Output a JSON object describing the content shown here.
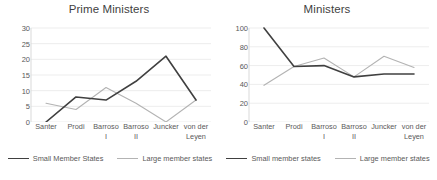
{
  "colors": {
    "small_member_states": "#404040",
    "large_member_states": "#b3b3b3",
    "text": "#595959",
    "title": "#3f3f3f",
    "gridline": "#ededed",
    "background": "#ffffff"
  },
  "charts": [
    {
      "id": "prime-ministers",
      "title": "Prime Ministers",
      "legend": [
        {
          "label": "Small Member States",
          "key": "small"
        },
        {
          "label": "Large member states",
          "key": "large"
        }
      ]
    },
    {
      "id": "ministers",
      "title": "Ministers",
      "legend": [
        {
          "label": "Small member states",
          "key": "small"
        },
        {
          "label": "Large member states",
          "key": "large"
        }
      ]
    }
  ],
  "chart_data": [
    {
      "type": "line",
      "title": "Prime Ministers",
      "xlabel": "",
      "ylabel": "",
      "categories": [
        "Santer",
        "Prodi",
        "Barroso I",
        "Barroso II",
        "Juncker",
        "von der Leyen"
      ],
      "category_lines": [
        [
          "Santer"
        ],
        [
          "Prodi"
        ],
        [
          "Barroso",
          "I"
        ],
        [
          "Barroso",
          "II"
        ],
        [
          "Juncker"
        ],
        [
          "von der",
          "Leyen"
        ]
      ],
      "series": [
        {
          "name": "Small Member States",
          "values": [
            0,
            8,
            7,
            13,
            21,
            7
          ],
          "color": "#404040"
        },
        {
          "name": "Large member states",
          "values": [
            6,
            4,
            11,
            6,
            0,
            7
          ],
          "color": "#b3b3b3"
        }
      ],
      "ylim": [
        0,
        30
      ],
      "yticks": [
        0,
        5,
        10,
        15,
        20,
        25,
        30
      ],
      "grid": true,
      "legend_position": "bottom"
    },
    {
      "type": "line",
      "title": "Ministers",
      "xlabel": "",
      "ylabel": "",
      "categories": [
        "Santer",
        "Prodi",
        "Barroso I",
        "Barroso II",
        "Juncker",
        "von der Leyen"
      ],
      "category_lines": [
        [
          "Santer"
        ],
        [
          "Prodi"
        ],
        [
          "Barroso",
          "I"
        ],
        [
          "Barroso",
          "II"
        ],
        [
          "Juncker"
        ],
        [
          "von der",
          "Leyen"
        ]
      ],
      "series": [
        {
          "name": "Small member states",
          "values": [
            100,
            59,
            60,
            48,
            51,
            51
          ],
          "color": "#404040"
        },
        {
          "name": "Large member states",
          "values": [
            39,
            59,
            68,
            48,
            70,
            58
          ],
          "color": "#b3b3b3"
        }
      ],
      "ylim": [
        0,
        100
      ],
      "yticks": [
        0,
        20,
        40,
        60,
        80,
        100
      ],
      "grid": true,
      "legend_position": "bottom"
    }
  ]
}
